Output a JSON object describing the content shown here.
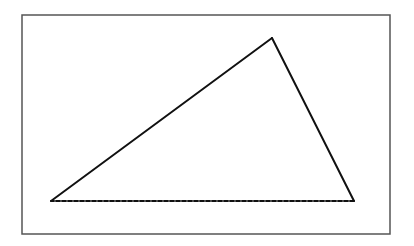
{
  "canvas": {
    "width": 414,
    "height": 246,
    "background": "#ffffff"
  },
  "frame": {
    "x": 22,
    "y": 15,
    "width": 368,
    "height": 219,
    "stroke": "#555555",
    "stroke_width": 1.5
  },
  "triangle": {
    "vertices": {
      "left": {
        "x": 51,
        "y": 201
      },
      "top": {
        "x": 272,
        "y": 38
      },
      "right": {
        "x": 354,
        "y": 201
      }
    },
    "stroke": "#111111",
    "stroke_width": 2,
    "edges": [
      {
        "name": "left-to-top",
        "style": "solid"
      },
      {
        "name": "top-to-right",
        "style": "solid"
      },
      {
        "name": "right-to-left",
        "style": "dashed",
        "dasharray": "4 2"
      }
    ]
  }
}
